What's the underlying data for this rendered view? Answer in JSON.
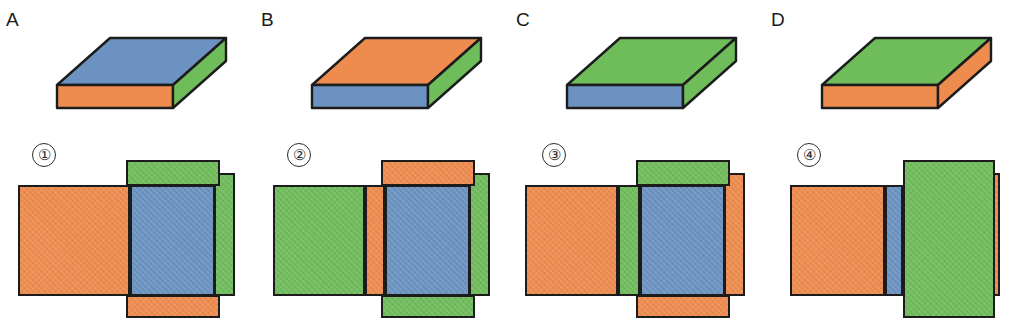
{
  "page": {
    "background_color": "#ffffff",
    "width": 1020,
    "height": 325
  },
  "palette": {
    "orange": "#ee8b4e",
    "blue": "#6b92c1",
    "green": "#6fbc5b",
    "outline": "#1c1c1c",
    "text": "#1a1a1a"
  },
  "blocks": [
    {
      "label": "A",
      "top_face_color": "#6b92c1",
      "front_face_color": "#ee8b4e",
      "right_face_color": "#6fbc5b",
      "top_face_name": "blue",
      "front_face_name": "orange",
      "right_face_name": "green"
    },
    {
      "label": "B",
      "top_face_color": "#ee8b4e",
      "front_face_color": "#6b92c1",
      "right_face_color": "#6fbc5b",
      "top_face_name": "orange",
      "front_face_name": "blue",
      "right_face_name": "green"
    },
    {
      "label": "C",
      "top_face_color": "#6fbc5b",
      "front_face_color": "#6b92c1",
      "right_face_color": "#6fbc5b",
      "top_face_name": "green",
      "front_face_name": "blue",
      "right_face_name": "green"
    },
    {
      "label": "D",
      "top_face_color": "#6fbc5b",
      "front_face_color": "#ee8b4e",
      "right_face_color": "#ee8b4e",
      "top_face_name": "green",
      "front_face_name": "orange",
      "right_face_name": "orange"
    }
  ],
  "nets": [
    {
      "label": "①",
      "number": 1,
      "pieces": [
        {
          "name": "left-panel",
          "color_name": "orange",
          "color": "#ee8b4e",
          "x": 18,
          "y": 185,
          "w": 112,
          "h": 111
        },
        {
          "name": "right-strip",
          "color_name": "green",
          "color": "#6fbc5b",
          "x": 214,
          "y": 173,
          "w": 21,
          "h": 123
        },
        {
          "name": "center-panel",
          "color_name": "blue",
          "color": "#6b92c1",
          "x": 130,
          "y": 185,
          "w": 85,
          "h": 111
        },
        {
          "name": "top-tab",
          "color_name": "green",
          "color": "#6fbc5b",
          "x": 126,
          "y": 160,
          "w": 94,
          "h": 26
        },
        {
          "name": "bottom-tab",
          "color_name": "orange",
          "color": "#ee8b4e",
          "x": 126,
          "y": 295,
          "w": 94,
          "h": 23
        }
      ]
    },
    {
      "label": "②",
      "number": 2,
      "pieces": [
        {
          "name": "left-panel",
          "color_name": "green",
          "color": "#6fbc5b",
          "x": 18,
          "y": 185,
          "w": 92,
          "h": 111
        },
        {
          "name": "right-strip",
          "color_name": "green",
          "color": "#6fbc5b",
          "x": 214,
          "y": 173,
          "w": 21,
          "h": 123
        },
        {
          "name": "mid-strip",
          "color_name": "orange",
          "color": "#ee8b4e",
          "x": 110,
          "y": 185,
          "w": 20,
          "h": 111
        },
        {
          "name": "center-panel",
          "color_name": "blue",
          "color": "#6b92c1",
          "x": 130,
          "y": 185,
          "w": 85,
          "h": 111
        },
        {
          "name": "top-tab",
          "color_name": "orange",
          "color": "#ee8b4e",
          "x": 126,
          "y": 160,
          "w": 94,
          "h": 26
        },
        {
          "name": "bottom-tab",
          "color_name": "green",
          "color": "#6fbc5b",
          "x": 126,
          "y": 295,
          "w": 94,
          "h": 23
        }
      ]
    },
    {
      "label": "③",
      "number": 3,
      "pieces": [
        {
          "name": "left-panel",
          "color_name": "orange",
          "color": "#ee8b4e",
          "x": 15,
          "y": 185,
          "w": 93,
          "h": 111
        },
        {
          "name": "right-strip",
          "color_name": "orange",
          "color": "#ee8b4e",
          "x": 214,
          "y": 173,
          "w": 21,
          "h": 123
        },
        {
          "name": "mid-strip",
          "color_name": "green",
          "color": "#6fbc5b",
          "x": 108,
          "y": 185,
          "w": 22,
          "h": 111
        },
        {
          "name": "center-panel",
          "color_name": "blue",
          "color": "#6b92c1",
          "x": 130,
          "y": 185,
          "w": 85,
          "h": 111
        },
        {
          "name": "top-tab",
          "color_name": "green",
          "color": "#6fbc5b",
          "x": 126,
          "y": 160,
          "w": 94,
          "h": 26
        },
        {
          "name": "bottom-tab",
          "color_name": "orange",
          "color": "#ee8b4e",
          "x": 126,
          "y": 295,
          "w": 94,
          "h": 23
        }
      ]
    },
    {
      "label": "④",
      "number": 4,
      "pieces": [
        {
          "name": "left-panel",
          "color_name": "orange",
          "color": "#ee8b4e",
          "x": 25,
          "y": 185,
          "w": 95,
          "h": 111
        },
        {
          "name": "right-strip",
          "color_name": "orange",
          "color": "#ee8b4e",
          "x": 214,
          "y": 173,
          "w": 21,
          "h": 123
        },
        {
          "name": "mid-strip",
          "color_name": "blue",
          "color": "#6b92c1",
          "x": 120,
          "y": 185,
          "w": 18,
          "h": 111
        },
        {
          "name": "big-green",
          "color_name": "green",
          "color": "#6fbc5b",
          "x": 138,
          "y": 160,
          "w": 92,
          "h": 158
        }
      ]
    }
  ]
}
